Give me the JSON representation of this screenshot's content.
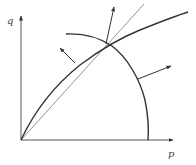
{
  "diagram": {
    "axes": {
      "x_label": "p",
      "y_label": "q",
      "origin": [
        21,
        140
      ],
      "x_end": [
        174,
        140
      ],
      "y_end": [
        21,
        15
      ]
    },
    "curves": [
      {
        "name": "concave-frontier-curve",
        "description": "thick curve rising from origin, concave"
      },
      {
        "name": "circular-arc",
        "description": "arc from upper-left down to p-axis"
      },
      {
        "name": "ray-from-origin",
        "description": "thin straight line through the intersection point"
      }
    ],
    "intersection_point": [
      106,
      44
    ],
    "arrows": [
      {
        "name": "normal-arrow-left",
        "from": [
          75,
          63
        ],
        "to": [
          60,
          48
        ]
      },
      {
        "name": "normal-arrow-up",
        "from": [
          106,
          44
        ],
        "to": [
          114,
          6
        ]
      },
      {
        "name": "ray-extension",
        "from": [
          106,
          44
        ],
        "to": [
          144,
          4
        ]
      },
      {
        "name": "normal-arrow-right",
        "from": [
          138,
          79
        ],
        "to": [
          172,
          66
        ]
      }
    ],
    "colors": {
      "line": "#333333",
      "thin_line": "#777777",
      "background": "#ffffff"
    }
  }
}
